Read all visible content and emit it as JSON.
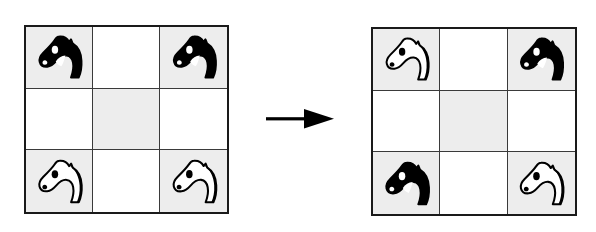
{
  "figure": {
    "background_color": "#ffffff",
    "line_color": "#1a1a1a",
    "shaded_cell_color": "#ededed",
    "plain_cell_color": "#ffffff",
    "black_piece_color": "#000000",
    "white_piece_color": "#ffffff"
  },
  "arrow": {
    "name": "rightward-arrow",
    "direction": "right",
    "color": "#000000"
  },
  "boards": [
    {
      "id": "left",
      "label": "start-position",
      "rows": 3,
      "columns": 3,
      "cells": [
        {
          "row": 0,
          "col": 0,
          "shade": "shaded",
          "piece": "knight",
          "piece_color": "black",
          "facing": "left"
        },
        {
          "row": 0,
          "col": 1,
          "shade": "plain",
          "piece": null,
          "piece_color": null,
          "facing": null
        },
        {
          "row": 0,
          "col": 2,
          "shade": "shaded",
          "piece": "knight",
          "piece_color": "black",
          "facing": "left"
        },
        {
          "row": 1,
          "col": 0,
          "shade": "plain",
          "piece": null,
          "piece_color": null,
          "facing": null
        },
        {
          "row": 1,
          "col": 1,
          "shade": "shaded",
          "piece": null,
          "piece_color": null,
          "facing": null
        },
        {
          "row": 1,
          "col": 2,
          "shade": "plain",
          "piece": null,
          "piece_color": null,
          "facing": null
        },
        {
          "row": 2,
          "col": 0,
          "shade": "shaded",
          "piece": "knight",
          "piece_color": "white",
          "facing": "left"
        },
        {
          "row": 2,
          "col": 1,
          "shade": "plain",
          "piece": null,
          "piece_color": null,
          "facing": null
        },
        {
          "row": 2,
          "col": 2,
          "shade": "shaded",
          "piece": "knight",
          "piece_color": "white",
          "facing": "left"
        }
      ]
    },
    {
      "id": "right",
      "label": "end-position",
      "rows": 3,
      "columns": 3,
      "cells": [
        {
          "row": 0,
          "col": 0,
          "shade": "shaded",
          "piece": "knight",
          "piece_color": "white",
          "facing": "left"
        },
        {
          "row": 0,
          "col": 1,
          "shade": "plain",
          "piece": null,
          "piece_color": null,
          "facing": null
        },
        {
          "row": 0,
          "col": 2,
          "shade": "shaded",
          "piece": "knight",
          "piece_color": "black",
          "facing": "left"
        },
        {
          "row": 1,
          "col": 0,
          "shade": "plain",
          "piece": null,
          "piece_color": null,
          "facing": null
        },
        {
          "row": 1,
          "col": 1,
          "shade": "shaded",
          "piece": null,
          "piece_color": null,
          "facing": null
        },
        {
          "row": 1,
          "col": 2,
          "shade": "plain",
          "piece": null,
          "piece_color": null,
          "facing": null
        },
        {
          "row": 2,
          "col": 0,
          "shade": "shaded",
          "piece": "knight",
          "piece_color": "black",
          "facing": "left"
        },
        {
          "row": 2,
          "col": 1,
          "shade": "plain",
          "piece": null,
          "piece_color": null,
          "facing": null
        },
        {
          "row": 2,
          "col": 2,
          "shade": "shaded",
          "piece": "knight",
          "piece_color": "white",
          "facing": "left"
        }
      ]
    }
  ]
}
